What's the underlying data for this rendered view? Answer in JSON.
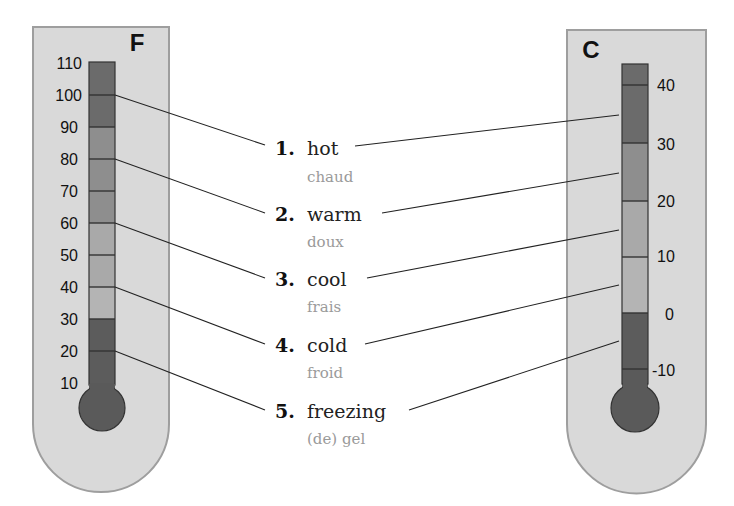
{
  "left_thermometer": {
    "unit": "F",
    "ticks": [
      "110",
      "100",
      "90",
      "80",
      "70",
      "60",
      "50",
      "40",
      "30",
      "20",
      "10"
    ]
  },
  "right_thermometer": {
    "unit": "C",
    "ticks": [
      "40",
      "30",
      "20",
      "10",
      "0",
      "-10"
    ]
  },
  "labels": [
    {
      "number": "1.",
      "english": "hot",
      "french": "chaud"
    },
    {
      "number": "2.",
      "english": "warm",
      "french": "doux"
    },
    {
      "number": "3.",
      "english": "cool",
      "french": "frais"
    },
    {
      "number": "4.",
      "english": "cold",
      "french": "froid"
    },
    {
      "number": "5.",
      "english": "freezing",
      "french": "(de) gel"
    }
  ],
  "colors": {
    "casing": "#d9d9d9",
    "casing_border": "#9e9e9e",
    "hot": "#6b6b6b",
    "warm": "#8e8e8e",
    "cool": "#a9a9a9",
    "cold": "#5c5c5c",
    "bulb": "#5a5a5a",
    "french_text": "#9a9a9a"
  }
}
